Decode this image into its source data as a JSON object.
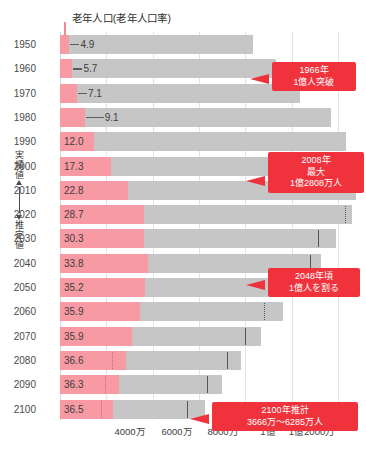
{
  "title": "老年人口(老年人口率)",
  "side_axis": {
    "actual_label": "実績値",
    "estimate_label": "推定値"
  },
  "x_axis": {
    "ticks": [
      {
        "label": "4000万",
        "value": 40000000,
        "x": 130
      },
      {
        "label": "6000万",
        "value": 60000000,
        "x": 177
      },
      {
        "label": "8000万",
        "value": 80000000,
        "x": 223
      },
      {
        "label": "1億",
        "value": 100000000,
        "x": 268
      },
      {
        "label": "1億2000万",
        "value": 120000000,
        "x": 312
      }
    ]
  },
  "callouts": [
    {
      "id": "c1966",
      "lines": [
        "1966年",
        "1億人突破"
      ],
      "left": 272,
      "top": 62,
      "width": 84,
      "tail_x": 268,
      "tail_y": 78
    },
    {
      "id": "c2008",
      "lines": [
        "2008年",
        "最大",
        "1億2808万人"
      ],
      "left": 268,
      "top": 152,
      "width": 96,
      "tail_x": 264,
      "tail_y": 180
    },
    {
      "id": "c2048",
      "lines": [
        "2048年頃",
        "1億人を割る"
      ],
      "left": 268,
      "top": 268,
      "width": 92,
      "tail_x": 264,
      "tail_y": 284
    },
    {
      "id": "c2100",
      "lines": [
        "2100年推計",
        "3666万～6285万人"
      ],
      "left": 212,
      "top": 402,
      "width": 146,
      "tail_x": 208,
      "tail_y": 418
    }
  ],
  "chart_data": {
    "type": "bar",
    "title": "老年人口(老年人口率)",
    "xlabel": "",
    "ylabel": "",
    "xlim": [
      0,
      130000000
    ],
    "grid": true,
    "legend_position": "none",
    "categories": [
      "1950",
      "1960",
      "1970",
      "1980",
      "1990",
      "2000",
      "2010",
      "2020",
      "2030",
      "2040",
      "2050",
      "2060",
      "2070",
      "2080",
      "2090",
      "2100"
    ],
    "series": [
      {
        "name": "老年人口率(%)",
        "values": [
          4.9,
          5.7,
          7.1,
          9.1,
          12.0,
          17.3,
          22.8,
          28.7,
          30.3,
          33.8,
          35.2,
          35.9,
          35.9,
          36.6,
          36.3,
          36.5
        ]
      },
      {
        "name": "総人口",
        "values": [
          83200000,
          93400000,
          103700000,
          117100000,
          123600000,
          126900000,
          128060000,
          126150000,
          119130000,
          112840000,
          104690000,
          96150000,
          87000000,
          78000000,
          70000000,
          62850000
        ]
      }
    ],
    "rows": [
      {
        "year": "1950",
        "pct": "4.9",
        "pct_inside": false,
        "pink_end": 4100000,
        "total": 83200000,
        "uncert": null,
        "uncert_style": null
      },
      {
        "year": "1960",
        "pct": "5.7",
        "pct_inside": false,
        "pink_end": 5350000,
        "total": 93400000,
        "uncert": null,
        "uncert_style": null
      },
      {
        "year": "1970",
        "pct": "7.1",
        "pct_inside": false,
        "pink_end": 7350000,
        "total": 103700000,
        "uncert": null,
        "uncert_style": null
      },
      {
        "year": "1980",
        "pct": "9.1",
        "pct_inside": false,
        "pink_end": 10650000,
        "total": 117100000,
        "uncert": null,
        "uncert_style": null
      },
      {
        "year": "1990",
        "pct": "12.0",
        "pct_inside": true,
        "pink_end": 14890000,
        "total": 123600000,
        "uncert": null,
        "uncert_style": null
      },
      {
        "year": "2000",
        "pct": "17.3",
        "pct_inside": true,
        "pink_end": 22040000,
        "total": 126900000,
        "uncert": null,
        "uncert_style": null
      },
      {
        "year": "2010",
        "pct": "22.8",
        "pct_inside": true,
        "pink_end": 29250000,
        "total": 128060000,
        "uncert": null,
        "uncert_style": null
      },
      {
        "year": "2020",
        "pct": "28.7",
        "pct_inside": true,
        "pink_end": 36190000,
        "total": 126150000,
        "uncert": 123000000,
        "uncert_style": "dotted"
      },
      {
        "year": "2030",
        "pct": "30.3",
        "pct_inside": true,
        "pink_end": 36100000,
        "total": 119130000,
        "uncert": 111500000,
        "uncert_style": "solid"
      },
      {
        "year": "2040",
        "pct": "33.8",
        "pct_inside": true,
        "pink_end": 38130000,
        "total": 112840000,
        "uncert": 108000000,
        "uncert_style": "solid"
      },
      {
        "year": "2050",
        "pct": "35.2",
        "pct_inside": true,
        "pink_end": 36850000,
        "total": 104690000,
        "uncert": 95000000,
        "uncert_style": "solid"
      },
      {
        "year": "2060",
        "pct": "35.9",
        "pct_inside": true,
        "pink_end": 34520000,
        "total": 96150000,
        "uncert": 88000000,
        "uncert_style": "dotted"
      },
      {
        "year": "2070",
        "pct": "35.9",
        "pct_inside": true,
        "pink_end": 31240000,
        "total": 87000000,
        "uncert": 80000000,
        "uncert_style": "solid"
      },
      {
        "year": "2080",
        "pct": "36.6",
        "pct_inside": true,
        "pink_end": 28550000,
        "total": 78000000,
        "uncert": 72000000,
        "uncert_style": "solid",
        "uncert2": 22500000,
        "uncert2_style": "pinkband"
      },
      {
        "year": "2090",
        "pct": "36.3",
        "pct_inside": true,
        "pink_end": 25420000,
        "total": 70000000,
        "uncert": 63500000,
        "uncert_style": "solid",
        "uncert2": 19500000,
        "uncert2_style": "pinkband"
      },
      {
        "year": "2100",
        "pct": "36.5",
        "pct_inside": true,
        "pink_end": 22930000,
        "total": 62850000,
        "uncert": 55000000,
        "uncert_style": "solid",
        "uncert2": 17500000,
        "uncert2_style": "pinkband"
      }
    ]
  }
}
